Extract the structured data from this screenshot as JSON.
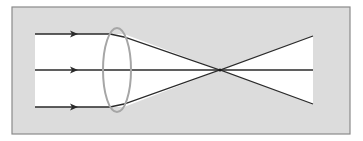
{
  "diagram": {
    "type": "converging-lens-ray-diagram",
    "colors": {
      "panel_fill": "#dcdcdc",
      "panel_border": "#8a8a8a",
      "beam_fill": "#ffffff",
      "ray_stroke": "#2a2a2a",
      "lens_stroke": "#a6a6a6"
    },
    "panel": {
      "x": 12,
      "y": 7,
      "width": 338,
      "height": 127
    },
    "rays": [
      {
        "name": "top",
        "start_x": 35,
        "y": 34
      },
      {
        "name": "middle",
        "start_x": 35,
        "y": 70
      },
      {
        "name": "bottom",
        "start_x": 35,
        "y": 107
      }
    ],
    "arrow_x": 75,
    "lens": {
      "cx": 117,
      "cy": 70,
      "rx": 14,
      "ry": 42
    },
    "bend_x": 124,
    "focal_point": {
      "x": 220,
      "y": 70
    },
    "end_x": 313,
    "end_top_y": 36,
    "end_bottom_y": 104
  }
}
